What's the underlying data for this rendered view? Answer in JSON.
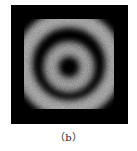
{
  "figure": {
    "caption": "（b）",
    "colors": {
      "background": "#000000",
      "ring": "#bdbdbd"
    },
    "rings": [
      {
        "name": "outer-ring",
        "radius": 45,
        "width": 16
      },
      {
        "name": "inner-ring",
        "radius": 18,
        "width": 14
      }
    ]
  }
}
